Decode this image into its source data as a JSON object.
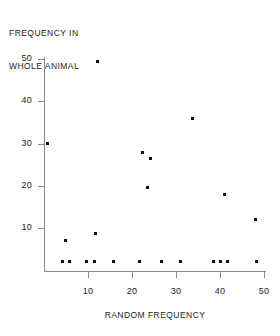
{
  "chart_data": {
    "type": "scatter",
    "title": "",
    "xlabel": "RANDOM FREQUENCY",
    "ylabel": "FREQUENCY IN WHOLE ANIMAL",
    "ylabel_lines": [
      "FREQUENCY IN",
      "WHOLE ANIMAL"
    ],
    "xlim": [
      0,
      50.5
    ],
    "ylim": [
      -0.4,
      50.5
    ],
    "xticks": [
      10,
      20,
      30,
      40,
      50
    ],
    "yticks": [
      10,
      20,
      30,
      40,
      50
    ],
    "xtick_labels": [
      "10",
      "20",
      "30",
      "40",
      "50"
    ],
    "ytick_labels": [
      "10",
      "20",
      "30",
      "40",
      "50"
    ],
    "grid": false,
    "legend": false,
    "marker": "square",
    "marker_color": "#111111",
    "axis_color": "#8a8a8a",
    "points": [
      {
        "x": 0.7,
        "y": 30.0
      },
      {
        "x": 4.8,
        "y": 7.0
      },
      {
        "x": 11.8,
        "y": 8.8
      },
      {
        "x": 12.2,
        "y": 49.5
      },
      {
        "x": 22.3,
        "y": 28.0
      },
      {
        "x": 24.2,
        "y": 26.4
      },
      {
        "x": 23.6,
        "y": 19.5
      },
      {
        "x": 33.8,
        "y": 36.0
      },
      {
        "x": 41.0,
        "y": 18.0
      },
      {
        "x": 48.1,
        "y": 12.0
      },
      {
        "x": 4.2,
        "y": 2.0
      },
      {
        "x": 5.9,
        "y": 2.0
      },
      {
        "x": 9.6,
        "y": 2.0
      },
      {
        "x": 11.5,
        "y": 2.0
      },
      {
        "x": 15.7,
        "y": 2.0
      },
      {
        "x": 21.8,
        "y": 2.0
      },
      {
        "x": 26.8,
        "y": 2.0
      },
      {
        "x": 31.0,
        "y": 2.0
      },
      {
        "x": 38.5,
        "y": 2.0
      },
      {
        "x": 40.2,
        "y": 2.0
      },
      {
        "x": 41.8,
        "y": 2.0
      },
      {
        "x": 48.4,
        "y": 2.0
      }
    ]
  }
}
